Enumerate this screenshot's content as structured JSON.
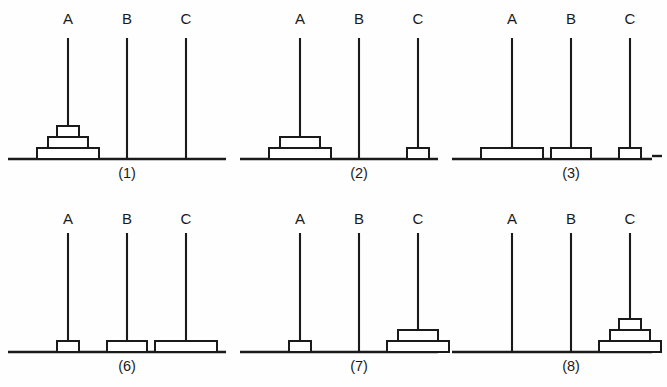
{
  "figure": {
    "background_color": "#fefefe",
    "ink_color": "#1a1a1a",
    "peg_labels": [
      "A",
      "B",
      "C"
    ],
    "disk_sizes": [
      "small",
      "medium",
      "large"
    ],
    "edge_tick_marks": 1
  },
  "panels": [
    {
      "caption": "(1)",
      "row": 0,
      "col": 0,
      "pegs": [
        {
          "label": "A",
          "disks": [
            "large",
            "medium",
            "small"
          ]
        },
        {
          "label": "B",
          "disks": []
        },
        {
          "label": "C",
          "disks": []
        }
      ]
    },
    {
      "caption": "(2)",
      "row": 0,
      "col": 1,
      "pegs": [
        {
          "label": "A",
          "disks": [
            "large",
            "medium"
          ]
        },
        {
          "label": "B",
          "disks": []
        },
        {
          "label": "C",
          "disks": [
            "small"
          ]
        }
      ]
    },
    {
      "caption": "(3)",
      "row": 0,
      "col": 2,
      "pegs": [
        {
          "label": "A",
          "disks": [
            "large"
          ]
        },
        {
          "label": "B",
          "disks": [
            "medium"
          ]
        },
        {
          "label": "C",
          "disks": [
            "small"
          ]
        }
      ]
    },
    {
      "caption": "(6)",
      "row": 1,
      "col": 0,
      "pegs": [
        {
          "label": "A",
          "disks": [
            "small"
          ]
        },
        {
          "label": "B",
          "disks": [
            "medium"
          ]
        },
        {
          "label": "C",
          "disks": [
            "large"
          ]
        }
      ]
    },
    {
      "caption": "(7)",
      "row": 1,
      "col": 1,
      "pegs": [
        {
          "label": "A",
          "disks": [
            "small"
          ]
        },
        {
          "label": "B",
          "disks": []
        },
        {
          "label": "C",
          "disks": [
            "large",
            "medium"
          ]
        }
      ]
    },
    {
      "caption": "(8)",
      "row": 1,
      "col": 2,
      "pegs": [
        {
          "label": "A",
          "disks": []
        },
        {
          "label": "B",
          "disks": []
        },
        {
          "label": "C",
          "disks": [
            "large",
            "medium",
            "small"
          ]
        }
      ]
    }
  ],
  "geometry": {
    "panel_origins_x": [
      8,
      240,
      452
    ],
    "panel_base_width": [
      218,
      198,
      200
    ],
    "row_baseline_y": [
      159,
      352
    ],
    "row_label_y": [
      24,
      224
    ],
    "row_peg_top_y": [
      38,
      233
    ],
    "row_caption_y": [
      178,
      371
    ],
    "peg_offsets_x": [
      60,
      119,
      178
    ],
    "disk_widths": {
      "small": 22,
      "medium": 40,
      "large": 62
    },
    "disk_height": 11
  }
}
